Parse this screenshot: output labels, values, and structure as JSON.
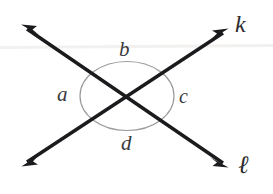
{
  "figure": {
    "background_color": "#ffffff",
    "width": 273,
    "height": 194,
    "line_color": "#1b1b1d",
    "arc_color": "#9a9a9e",
    "label_color": "#3a3a3c"
  },
  "lines": [
    {
      "id": "line-k",
      "label": "k",
      "from": {
        "x": 22,
        "y": 166
      },
      "to": {
        "x": 228,
        "y": 29
      },
      "arrow_start": true,
      "arrow_end": true
    },
    {
      "id": "line-l",
      "label": "ℓ",
      "from": {
        "x": 22,
        "y": 25
      },
      "to": {
        "x": 228,
        "y": 167
      },
      "arrow_start": true,
      "arrow_end": true
    }
  ],
  "intersection": {
    "x": 127,
    "y": 97
  },
  "angle_arc": {
    "center_x": 127,
    "center_y": 96,
    "radius_x": 47,
    "radius_y": 35,
    "stroke": "#9a9a9e",
    "stroke_width": 1.2
  },
  "angle_labels": [
    {
      "id": "a",
      "text": "a",
      "position": "left"
    },
    {
      "id": "b",
      "text": "b",
      "position": "top"
    },
    {
      "id": "c",
      "text": "c",
      "position": "right"
    },
    {
      "id": "d",
      "text": "d",
      "position": "bottom"
    }
  ],
  "artifact": {
    "scanline_y": 47,
    "color": "#f2f0ee"
  }
}
